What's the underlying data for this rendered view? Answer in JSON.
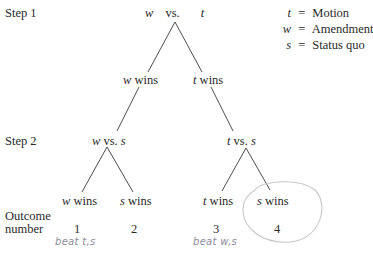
{
  "steps": {
    "step1_label": "Step 1",
    "step2_label": "Step 2",
    "outcome_label_line1": "Outcome",
    "outcome_label_line2": "number"
  },
  "tree": {
    "root": {
      "left": "w",
      "sep": "vs.",
      "right": "t"
    },
    "level1": {
      "left": {
        "var": "w",
        "text": "wins"
      },
      "right": {
        "var": "t",
        "text": "wins"
      }
    },
    "level2": {
      "left_contest": {
        "left": "w",
        "sep": "vs.",
        "right": "s"
      },
      "right_contest": {
        "left": "t",
        "sep": "vs.",
        "right": "s"
      }
    },
    "leaves": [
      {
        "var": "w",
        "text": "wins",
        "outcome": "1",
        "note": "beat t,s"
      },
      {
        "var": "s",
        "text": "wins",
        "outcome": "2",
        "note": ""
      },
      {
        "var": "t",
        "text": "wins",
        "outcome": "3",
        "note": "beat w,s"
      },
      {
        "var": "s",
        "text": "wins",
        "outcome": "4",
        "note": "",
        "circled": true
      }
    ]
  },
  "legend": [
    {
      "var": "t",
      "eq": "=",
      "meaning": "Motion"
    },
    {
      "var": "w",
      "eq": "=",
      "meaning": "Amendment"
    },
    {
      "var": "s",
      "eq": "=",
      "meaning": "Status quo"
    }
  ],
  "colors": {
    "text": "#2a2a2a",
    "lines": "#3a3a3a",
    "handwriting": "#8c8c9c",
    "circle": "#c8c8c8"
  }
}
